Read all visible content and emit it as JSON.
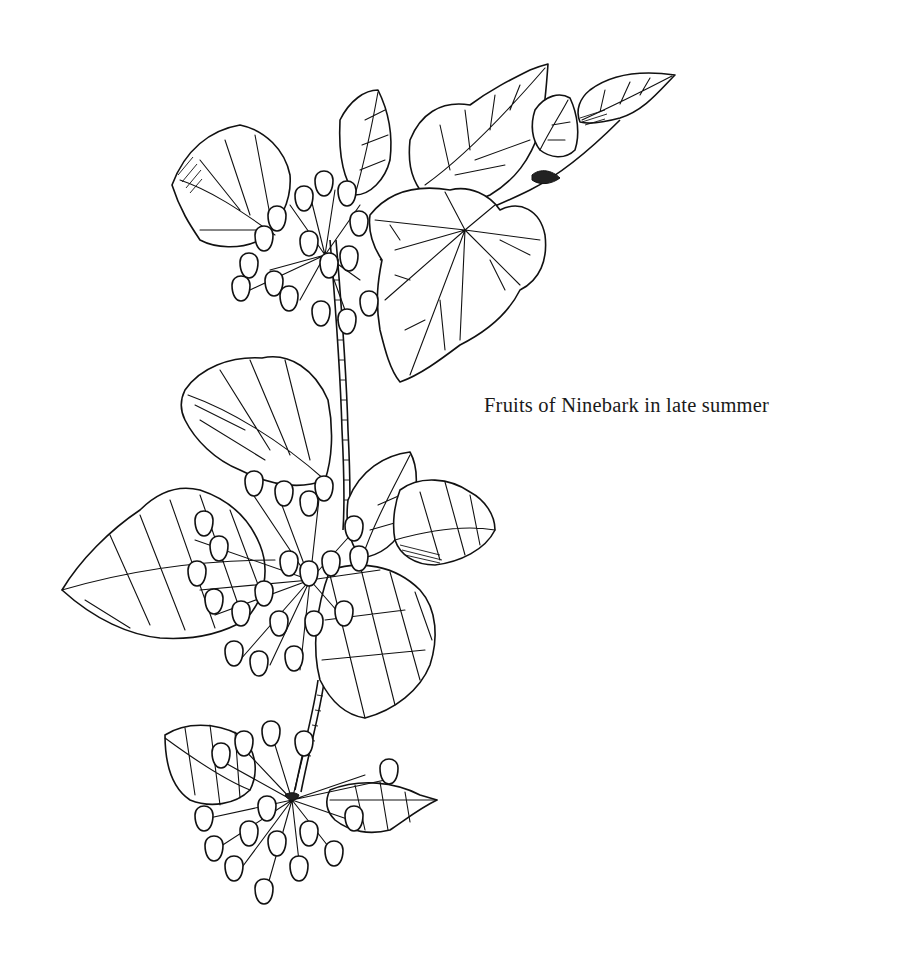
{
  "figure": {
    "style": "pen-and-ink botanical line drawing",
    "caption": "Fruits of Ninebark in late summer"
  },
  "colors": {
    "background": "#ffffff",
    "ink": "#111111",
    "caption_text": "#1a1a1a"
  }
}
